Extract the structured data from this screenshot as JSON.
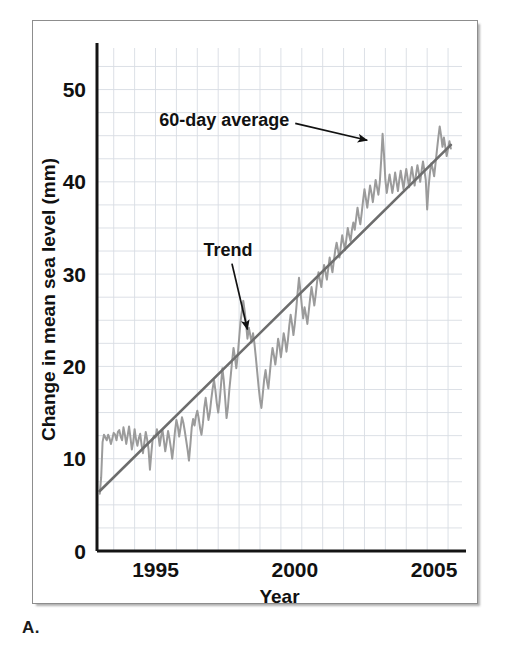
{
  "figure": {
    "panel_letter": "A.",
    "background_color": "#ffffff",
    "frame_color": "#8d8d8d"
  },
  "chart_data": {
    "type": "line",
    "title": "",
    "xlabel": "Year",
    "ylabel": "Change in mean sea level (mm)",
    "xlim": [
      1992.9,
      2006.0
    ],
    "ylim": [
      0,
      54.5
    ],
    "xticks": [
      1995,
      2000,
      2005
    ],
    "xtick_labels": [
      "1995",
      "2000",
      "2005"
    ],
    "yticks": [
      0,
      10,
      20,
      30,
      40,
      50
    ],
    "ytick_labels": [
      "0",
      "10",
      "20",
      "30",
      "40",
      "50"
    ],
    "grid": true,
    "grid_color": "#d8dde3",
    "grid_x_step": 0.75,
    "grid_y_step": 2.5,
    "legend": "none",
    "annotations": [
      {
        "text": "60-day average",
        "x": 1999.8,
        "y": 46.0,
        "arrow_to_x": 2002.6,
        "arrow_to_y": 44.5,
        "color": "#111111"
      },
      {
        "text": "Trend",
        "x": 1997.6,
        "y": 32.0,
        "arrow_to_x": 1998.3,
        "arrow_to_y": 24.0,
        "color": "#111111"
      }
    ],
    "series": [
      {
        "name": "60-day average",
        "color": "#9b9b9b",
        "line_width": 2.0,
        "x": [
          1993.0,
          1993.05,
          1993.1,
          1993.15,
          1993.2,
          1993.25,
          1993.3,
          1993.35,
          1993.4,
          1993.45,
          1993.5,
          1993.55,
          1993.6,
          1993.65,
          1993.7,
          1993.75,
          1993.8,
          1993.85,
          1993.9,
          1993.95,
          1994.0,
          1994.05,
          1994.1,
          1994.15,
          1994.2,
          1994.25,
          1994.3,
          1994.35,
          1994.4,
          1994.45,
          1994.5,
          1994.55,
          1994.6,
          1994.65,
          1994.7,
          1994.75,
          1994.8,
          1994.85,
          1994.9,
          1994.95,
          1995.0,
          1995.05,
          1995.1,
          1995.15,
          1995.2,
          1995.25,
          1995.3,
          1995.35,
          1995.4,
          1995.45,
          1995.5,
          1995.55,
          1995.6,
          1995.65,
          1995.7,
          1995.75,
          1995.8,
          1995.85,
          1995.9,
          1995.95,
          1996.0,
          1996.05,
          1996.1,
          1996.15,
          1996.2,
          1996.25,
          1996.3,
          1996.35,
          1996.4,
          1996.45,
          1996.5,
          1996.55,
          1996.6,
          1996.65,
          1996.7,
          1996.75,
          1996.8,
          1996.85,
          1996.9,
          1996.95,
          1997.0,
          1997.05,
          1997.1,
          1997.15,
          1997.2,
          1997.25,
          1997.3,
          1997.35,
          1997.4,
          1997.45,
          1997.5,
          1997.55,
          1997.6,
          1997.65,
          1997.7,
          1997.75,
          1997.8,
          1997.85,
          1997.9,
          1997.95,
          1998.0,
          1998.05,
          1998.1,
          1998.15,
          1998.2,
          1998.25,
          1998.3,
          1998.35,
          1998.4,
          1998.45,
          1998.5,
          1998.55,
          1998.6,
          1998.65,
          1998.7,
          1998.75,
          1998.8,
          1998.85,
          1998.9,
          1998.95,
          1999.0,
          1999.05,
          1999.1,
          1999.15,
          1999.2,
          1999.25,
          1999.3,
          1999.35,
          1999.4,
          1999.45,
          1999.5,
          1999.55,
          1999.6,
          1999.65,
          1999.7,
          1999.75,
          1999.8,
          1999.85,
          1999.9,
          1999.95,
          2000.0,
          2000.05,
          2000.1,
          2000.15,
          2000.2,
          2000.25,
          2000.3,
          2000.35,
          2000.4,
          2000.45,
          2000.5,
          2000.55,
          2000.6,
          2000.65,
          2000.7,
          2000.75,
          2000.8,
          2000.85,
          2000.9,
          2000.95,
          2001.0,
          2001.05,
          2001.1,
          2001.15,
          2001.2,
          2001.25,
          2001.3,
          2001.35,
          2001.4,
          2001.45,
          2001.5,
          2001.55,
          2001.6,
          2001.65,
          2001.7,
          2001.75,
          2001.8,
          2001.85,
          2001.9,
          2001.95,
          2002.0,
          2002.05,
          2002.1,
          2002.15,
          2002.2,
          2002.25,
          2002.3,
          2002.35,
          2002.4,
          2002.45,
          2002.5,
          2002.55,
          2002.6,
          2002.65,
          2002.7,
          2002.75,
          2002.8,
          2002.85,
          2002.9,
          2002.95,
          2003.0,
          2003.05,
          2003.1,
          2003.15,
          2003.2,
          2003.25,
          2003.3,
          2003.35,
          2003.4,
          2003.45,
          2003.5,
          2003.55,
          2003.6,
          2003.65,
          2003.7,
          2003.75,
          2003.8,
          2003.85,
          2003.9,
          2003.95,
          2004.0,
          2004.05,
          2004.1,
          2004.15,
          2004.2,
          2004.25,
          2004.3,
          2004.35,
          2004.4,
          2004.45,
          2004.5,
          2004.55,
          2004.6,
          2004.65,
          2004.7,
          2004.75,
          2004.8,
          2004.85,
          2004.9,
          2004.95,
          2005.0,
          2005.05,
          2005.1,
          2005.15,
          2005.2,
          2005.25,
          2005.3,
          2005.35,
          2005.4,
          2005.45,
          2005.5,
          2005.55,
          2005.6
        ],
        "y": [
          6.2,
          8.0,
          11.8,
          12.6,
          12.3,
          12.0,
          12.6,
          12.2,
          11.6,
          12.2,
          12.8,
          12.6,
          12.0,
          12.9,
          13.1,
          12.4,
          12.0,
          13.4,
          12.6,
          11.6,
          12.5,
          13.5,
          12.3,
          11.0,
          11.8,
          13.2,
          12.1,
          11.4,
          12.2,
          12.7,
          11.5,
          10.6,
          11.8,
          12.9,
          12.1,
          11.0,
          8.8,
          10.6,
          12.2,
          12.5,
          12.3,
          13.2,
          12.6,
          11.4,
          12.4,
          13.1,
          12.0,
          10.8,
          11.8,
          13.0,
          12.2,
          11.2,
          10.0,
          11.4,
          13.0,
          14.2,
          13.5,
          12.4,
          13.4,
          14.5,
          13.9,
          13.0,
          12.0,
          11.0,
          9.8,
          11.5,
          13.4,
          14.3,
          13.6,
          14.6,
          15.2,
          14.4,
          13.3,
          12.6,
          13.8,
          15.5,
          16.6,
          15.4,
          14.2,
          15.0,
          16.4,
          17.6,
          18.5,
          17.4,
          16.0,
          15.0,
          16.2,
          18.0,
          19.8,
          18.5,
          16.5,
          14.4,
          15.6,
          17.5,
          19.0,
          20.6,
          22.0,
          21.0,
          19.8,
          21.2,
          23.0,
          24.8,
          26.0,
          27.1,
          26.0,
          24.6,
          23.0,
          24.2,
          23.4,
          22.6,
          23.6,
          22.5,
          21.0,
          19.4,
          17.8,
          16.4,
          15.5,
          17.0,
          18.6,
          19.6,
          18.4,
          17.6,
          19.2,
          20.8,
          22.0,
          21.2,
          20.2,
          21.4,
          23.0,
          22.2,
          21.0,
          22.2,
          23.6,
          22.8,
          21.6,
          22.8,
          24.4,
          25.6,
          24.6,
          23.4,
          24.6,
          26.2,
          28.0,
          29.6,
          28.2,
          26.6,
          25.2,
          26.4,
          25.6,
          24.6,
          26.0,
          27.4,
          28.6,
          27.6,
          26.6,
          27.8,
          29.2,
          30.2,
          29.4,
          28.6,
          29.8,
          31.0,
          30.2,
          29.4,
          30.6,
          31.8,
          31.0,
          30.2,
          31.4,
          32.6,
          33.4,
          32.6,
          31.8,
          33.0,
          34.2,
          33.4,
          32.6,
          33.8,
          35.0,
          34.2,
          33.6,
          34.8,
          35.6,
          34.8,
          36.0,
          37.2,
          36.2,
          35.4,
          36.6,
          38.0,
          39.2,
          38.2,
          37.2,
          38.4,
          39.6,
          38.8,
          37.8,
          39.0,
          40.2,
          39.4,
          38.6,
          40.0,
          42.4,
          45.2,
          43.0,
          40.2,
          38.8,
          39.8,
          40.8,
          39.8,
          38.8,
          39.8,
          41.0,
          40.0,
          39.0,
          40.2,
          41.2,
          40.2,
          39.2,
          40.4,
          41.4,
          40.4,
          39.4,
          40.6,
          41.6,
          40.6,
          39.6,
          40.8,
          41.8,
          41.0,
          40.0,
          41.2,
          42.2,
          41.2,
          40.2,
          37.0,
          39.4,
          41.0,
          42.0,
          41.4,
          40.6,
          42.0,
          43.4,
          44.8,
          46.0,
          45.0,
          43.8,
          44.8,
          43.8,
          42.8,
          43.6,
          44.4,
          43.6
        ]
      },
      {
        "name": "Trend",
        "color": "#6d6d6d",
        "line_width": 2.6,
        "x": [
          1993.0,
          2005.6
        ],
        "y": [
          6.5,
          44.0
        ]
      }
    ]
  }
}
